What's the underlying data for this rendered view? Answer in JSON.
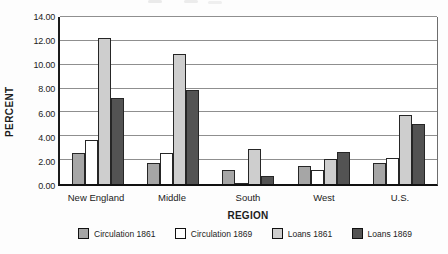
{
  "chart_data": {
    "type": "bar",
    "title": "",
    "xlabel": "REGION",
    "ylabel": "PERCENT",
    "ylim": [
      0,
      14
    ],
    "ytick_step": 2,
    "ytick_labels": [
      "14.00",
      "12.00",
      "10.00",
      "8.00",
      "6.00",
      "4.00",
      "2.00",
      "0.00"
    ],
    "categories": [
      "New England",
      "Middle",
      "South",
      "West",
      "U.S."
    ],
    "series": [
      {
        "name": "Circulation 1861",
        "color": "#a6a6a6",
        "values": [
          2.6,
          1.8,
          1.2,
          1.5,
          1.8
        ]
      },
      {
        "name": "Circulation 1869",
        "color": "#ffffff",
        "values": [
          3.7,
          2.6,
          0.1,
          1.2,
          2.2
        ]
      },
      {
        "name": "Loans 1861",
        "color": "#cecece",
        "values": [
          12.2,
          10.9,
          2.9,
          2.1,
          5.8
        ]
      },
      {
        "name": "Loans 1869",
        "color": "#535353",
        "values": [
          7.2,
          7.9,
          0.7,
          2.7,
          5.0
        ]
      }
    ],
    "grid": true,
    "legend_position": "bottom",
    "colors": {
      "gridline": "#8f8f8f",
      "axis": "#1c1c1c",
      "bar_border": "#262626",
      "background": "#ffffff"
    }
  }
}
